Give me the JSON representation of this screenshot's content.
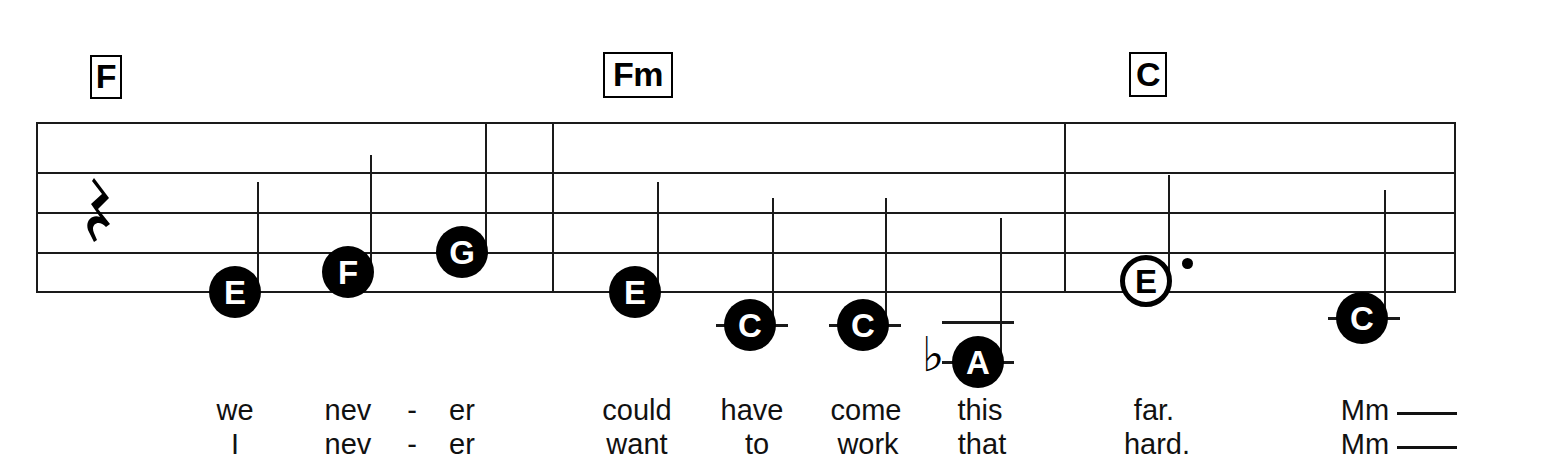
{
  "score": {
    "title_visible": false,
    "staff": {
      "left": 36,
      "right": 1456,
      "top": 122,
      "line_spacing": 39,
      "line_count": 5,
      "ink_color": "#1a1a1a"
    },
    "chords": [
      {
        "name": "chord-f",
        "label": "F",
        "x": 90,
        "y": 55
      },
      {
        "name": "chord-fm",
        "label": "Fm",
        "x": 603,
        "y": 52
      },
      {
        "name": "chord-c",
        "label": "C",
        "x": 1129,
        "y": 52
      }
    ],
    "rest": {
      "name": "quarter-rest",
      "symbol": " ",
      "x": 86,
      "y": 178
    },
    "barlines": [
      {
        "name": "barline-measure-1",
        "x": 552
      },
      {
        "name": "barline-measure-2",
        "x": 1064
      },
      {
        "name": "barline-final",
        "x": 1454
      }
    ],
    "notes": [
      {
        "name": "note-e-1",
        "pitch": "E",
        "head": "filled",
        "x": 235,
        "y": 292,
        "stem": "up",
        "stem_top": 182,
        "ledger": false,
        "accidental": "",
        "dotted": false,
        "lyric_top": "we",
        "lyric_bottom": "I"
      },
      {
        "name": "note-f-1",
        "pitch": "F",
        "head": "filled",
        "x": 348,
        "y": 272,
        "stem": "up",
        "stem_top": 155,
        "ledger": false,
        "accidental": "",
        "dotted": false,
        "lyric_top": "nev",
        "lyric_bottom": "nev"
      },
      {
        "name": "hyphen-1",
        "pitch": "",
        "head": "none",
        "x": 412,
        "y": 0,
        "stem": "none",
        "stem_top": 0,
        "ledger": false,
        "accidental": "",
        "dotted": false,
        "lyric_top": "-",
        "lyric_bottom": "-"
      },
      {
        "name": "note-g-1",
        "pitch": "G",
        "head": "filled",
        "x": 462,
        "y": 252,
        "stem": "up",
        "stem_top": 122,
        "ledger": false,
        "accidental": "",
        "dotted": false,
        "lyric_top": "er",
        "lyric_bottom": "er"
      },
      {
        "name": "note-e-2",
        "pitch": "E",
        "head": "filled",
        "x": 635,
        "y": 292,
        "stem": "up",
        "stem_top": 182,
        "ledger": false,
        "accidental": "",
        "dotted": false,
        "lyric_top": "could",
        "lyric_bottom": "want"
      },
      {
        "name": "note-c-1",
        "pitch": "C",
        "head": "filled",
        "x": 750,
        "y": 325,
        "stem": "up",
        "stem_top": 198,
        "ledger": true,
        "accidental": "",
        "dotted": false,
        "lyric_top": "have",
        "lyric_bottom": "to"
      },
      {
        "name": "note-c-2",
        "pitch": "C",
        "head": "filled",
        "x": 863,
        "y": 325,
        "stem": "up",
        "stem_top": 198,
        "ledger": true,
        "accidental": "",
        "dotted": false,
        "lyric_top": "come",
        "lyric_bottom": "work"
      },
      {
        "name": "note-a-flat",
        "pitch": "A",
        "head": "filled",
        "x": 978,
        "y": 362,
        "stem": "up",
        "stem_top": 218,
        "ledger": true,
        "accidental": "♭",
        "dotted": false,
        "lyric_top": "this",
        "lyric_bottom": "that"
      },
      {
        "name": "note-e-3",
        "pitch": "E",
        "head": "open",
        "x": 1146,
        "y": 281,
        "stem": "none",
        "stem_top": 0,
        "ledger": false,
        "accidental": "",
        "dotted": true,
        "lyric_top": "far.",
        "lyric_bottom": "hard."
      },
      {
        "name": "note-c-3",
        "pitch": "C",
        "head": "filled",
        "x": 1362,
        "y": 318,
        "stem": "up",
        "stem_top": 190,
        "ledger": true,
        "accidental": "",
        "dotted": false,
        "lyric_top": "Mm",
        "lyric_bottom": "Mm",
        "melisma": true
      }
    ],
    "lyrics": {
      "row_top_y": 398,
      "row_bottom_y": 433,
      "line_1": [
        "we",
        "nev",
        "-",
        "er",
        "could",
        "have",
        "come",
        "this",
        "far.",
        "Mm"
      ],
      "line_2": [
        "I",
        "nev",
        "-",
        "er",
        "want",
        "to",
        "work",
        "that",
        "hard.",
        "Mm"
      ]
    }
  }
}
